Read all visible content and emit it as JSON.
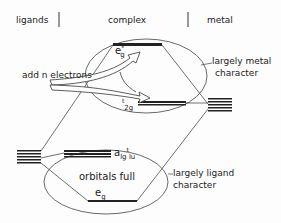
{
  "header": {
    "columns": [
      "ligands",
      "complex",
      "metal"
    ]
  },
  "annotations": {
    "add_electrons": "add n electrons",
    "metal_region": [
      "largely metal",
      "character"
    ],
    "ligand_region": [
      "largely ligand",
      "character"
    ],
    "orbitals_full": "orbitals full"
  },
  "orbitals": {
    "eg_star": {
      "base": "e",
      "sub": "g",
      "sup": "*"
    },
    "t2g": {
      "pre_sup": "t",
      "base": "",
      "sub": "2g"
    },
    "a1g_t1u": {
      "base": "a",
      "sub1": "lg",
      "mid": "t",
      "sub2": "lu"
    },
    "eg": {
      "base": "e",
      "sub": "g"
    }
  },
  "colors": {
    "line": "#333333",
    "text": "#222222",
    "background": "#fdfdfd"
  }
}
